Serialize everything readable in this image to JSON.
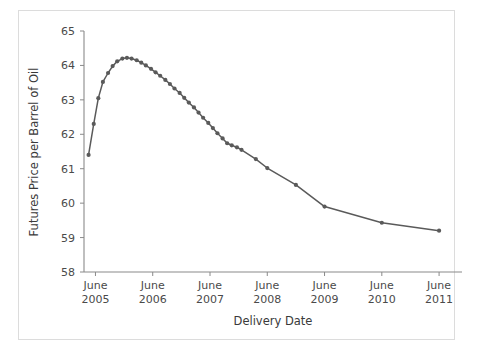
{
  "figure": {
    "background_color": "#ffffff",
    "border_color": "#dcdcdc",
    "line_color": "#5a5a5a",
    "axis_color": "#8a8a8a",
    "text_color": "#4a4a4a"
  },
  "chart_data": {
    "type": "line",
    "title": "",
    "subtitle": "",
    "xlabel": "Delivery Date",
    "ylabel": "Futures Price per Barrel of Oil",
    "ylim": [
      58,
      65
    ],
    "yticks": [
      58,
      59,
      60,
      61,
      62,
      63,
      64,
      65
    ],
    "yticklabels": [
      "58",
      "59",
      "60",
      "61",
      "62",
      "63",
      "64",
      "65"
    ],
    "xlim": [
      2005.25,
      2011.85
    ],
    "xticks": [
      2005.45,
      2006.45,
      2007.45,
      2008.45,
      2009.45,
      2010.45,
      2011.45
    ],
    "xticklabels": [
      "June\n2005",
      "June\n2006",
      "June\n2007",
      "June\n2008",
      "June\n2009",
      "June\n2010",
      "June\n2011"
    ],
    "xtick_labels_line1": [
      "June",
      "June",
      "June",
      "June",
      "June",
      "June",
      "June"
    ],
    "xtick_labels_line2": [
      "2005",
      "2006",
      "2007",
      "2008",
      "2009",
      "2010",
      "2011"
    ],
    "grid": false,
    "legend": false,
    "legend_position": "none",
    "marker": "circle",
    "series": [
      {
        "name": "Oil futures price",
        "x": [
          2005.33,
          2005.42,
          2005.5,
          2005.58,
          2005.67,
          2005.75,
          2005.83,
          2005.92,
          2006.0,
          2006.08,
          2006.17,
          2006.25,
          2006.33,
          2006.42,
          2006.5,
          2006.58,
          2006.67,
          2006.75,
          2006.83,
          2006.92,
          2007.0,
          2007.08,
          2007.17,
          2007.25,
          2007.33,
          2007.42,
          2007.5,
          2007.58,
          2007.67,
          2007.75,
          2007.83,
          2007.92,
          2008.0,
          2008.25,
          2008.45,
          2008.95,
          2009.45,
          2010.45,
          2011.45
        ],
        "y": [
          61.4,
          62.3,
          63.05,
          63.52,
          63.78,
          63.98,
          64.12,
          64.2,
          64.22,
          64.2,
          64.15,
          64.08,
          64.0,
          63.9,
          63.8,
          63.7,
          63.58,
          63.46,
          63.33,
          63.2,
          63.06,
          62.92,
          62.78,
          62.63,
          62.48,
          62.33,
          62.18,
          62.03,
          61.88,
          61.74,
          61.68,
          61.62,
          61.55,
          61.28,
          61.02,
          60.53,
          59.9,
          59.43,
          59.2
        ]
      }
    ],
    "annotations": []
  }
}
